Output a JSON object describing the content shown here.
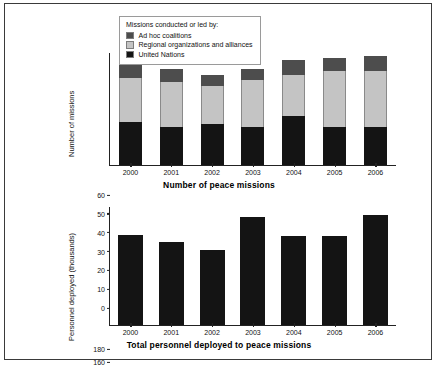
{
  "figure": {
    "border_color": "#3a3a3a",
    "background": "#ffffff"
  },
  "legend": {
    "title": "Missions conducted or led by:",
    "entries": [
      {
        "label": "Ad hoc coalitions",
        "color": "#4d4d4d",
        "key": "adhoc"
      },
      {
        "label": "Regional organizations and alliances",
        "color": "#c4c4c4",
        "key": "regional"
      },
      {
        "label": "United Nations",
        "color": "#141414",
        "key": "un"
      }
    ]
  },
  "chart_data": [
    {
      "type": "bar",
      "stacked": true,
      "title": "Number of peace missions",
      "xlabel": "",
      "ylabel": "Number of missions",
      "ylim": [
        0,
        60
      ],
      "yticks": [
        0,
        10,
        20,
        30,
        40,
        50,
        60
      ],
      "grid": false,
      "legend_position": "top-center",
      "categories": [
        "2000",
        "2001",
        "2002",
        "2003",
        "2004",
        "2005",
        "2006"
      ],
      "series": [
        {
          "name": "United Nations",
          "color": "#141414",
          "values": [
            23,
            20,
            22,
            20,
            26,
            20,
            20
          ]
        },
        {
          "name": "Regional organizations and alliances",
          "color": "#c4c4c4",
          "values": [
            23,
            24,
            20,
            25,
            22,
            30,
            30
          ]
        },
        {
          "name": "Ad hoc coalitions",
          "color": "#4d4d4d",
          "values": [
            7,
            7,
            6,
            6,
            8,
            7,
            8
          ]
        }
      ],
      "totals": [
        53,
        51,
        48,
        51,
        56,
        57,
        58
      ]
    },
    {
      "type": "bar",
      "stacked": false,
      "title": "Total personnel deployed to peace missions",
      "xlabel": "",
      "ylabel": "Personnel deployed (thousands)",
      "ylim": [
        0,
        180
      ],
      "yticks": [
        0,
        20,
        40,
        60,
        80,
        100,
        120,
        140,
        160,
        180
      ],
      "grid": false,
      "categories": [
        "2000",
        "2001",
        "2002",
        "2003",
        "2004",
        "2005",
        "2006"
      ],
      "series": [
        {
          "name": "Personnel deployed",
          "color": "#141414",
          "values": [
            136,
            126,
            113,
            164,
            134,
            134,
            167
          ]
        }
      ]
    }
  ]
}
